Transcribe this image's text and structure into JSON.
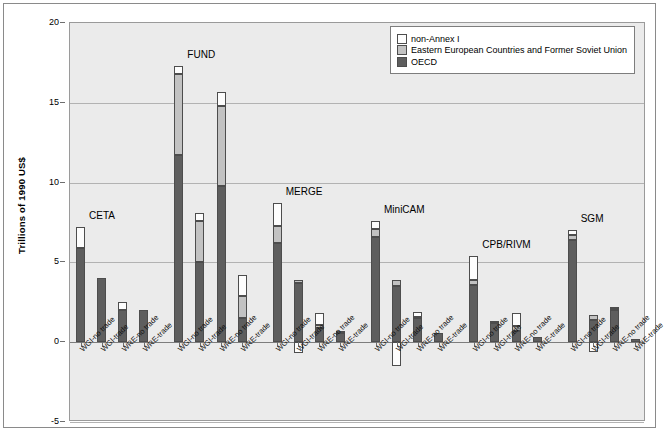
{
  "chart_data": {
    "type": "bar",
    "stacked": true,
    "title": "",
    "xlabel": "",
    "ylabel": "Trillions of 1990 US$",
    "ylim": [
      -5,
      20
    ],
    "yticks": [
      20,
      15,
      10,
      5,
      0,
      -5
    ],
    "grid": true,
    "legend_position": "top-right",
    "series": [
      {
        "name": "non-Annex I",
        "color": "#fdfdfd"
      },
      {
        "name": "Eastern European Countries and Former Soviet Union",
        "color": "#c2c2c2"
      },
      {
        "name": "OECD",
        "color": "#5e5e5e"
      }
    ],
    "scenarios": [
      "WGI-no trade",
      "WGI-trade",
      "WRE-no trade",
      "WRE-trade"
    ],
    "groups": [
      {
        "name": "CETA",
        "bars": [
          {
            "scenario": "WGI-no trade",
            "OECD": 5.9,
            "EEU": 0.0,
            "nonAnnexI": 1.3,
            "total": 7.2
          },
          {
            "scenario": "WGI-trade",
            "OECD": 4.0,
            "EEU": 0.0,
            "nonAnnexI": 0.0,
            "total": 4.0
          },
          {
            "scenario": "WRE-no trade",
            "OECD": 2.0,
            "EEU": 0.0,
            "nonAnnexI": 0.5,
            "total": 2.5
          },
          {
            "scenario": "WRE-trade",
            "OECD": 2.0,
            "EEU": 0.0,
            "nonAnnexI": 0.0,
            "total": 2.0
          }
        ]
      },
      {
        "name": "FUND",
        "bars": [
          {
            "scenario": "WGI-no trade",
            "OECD": 11.7,
            "EEU": 5.1,
            "nonAnnexI": 0.5,
            "total": 17.3
          },
          {
            "scenario": "WGI-trade",
            "OECD": 5.0,
            "EEU": 2.6,
            "nonAnnexI": 0.5,
            "total": 8.1
          },
          {
            "scenario": "WRE-no trade",
            "OECD": 9.8,
            "EEU": 5.0,
            "nonAnnexI": 0.9,
            "total": 15.7
          },
          {
            "scenario": "WRE-trade",
            "OECD": 1.5,
            "EEU": 1.4,
            "nonAnnexI": 1.3,
            "total": 4.2
          }
        ]
      },
      {
        "name": "MERGE",
        "bars": [
          {
            "scenario": "WGI-no trade",
            "OECD": 6.2,
            "EEU": 1.1,
            "nonAnnexI": 1.4,
            "total": 8.7
          },
          {
            "scenario": "WGI-trade",
            "OECD": 3.7,
            "EEU": 0.2,
            "nonAnnexI": -0.7,
            "total": 3.9
          },
          {
            "scenario": "WRE-no trade",
            "OECD": 0.9,
            "EEU": 0.2,
            "nonAnnexI": 0.7,
            "total": 1.8
          },
          {
            "scenario": "WRE-trade",
            "OECD": 0.6,
            "EEU": 0.1,
            "nonAnnexI": 0.0,
            "total": 0.7
          }
        ]
      },
      {
        "name": "MiniCAM",
        "bars": [
          {
            "scenario": "WGI-no trade",
            "OECD": 6.6,
            "EEU": 0.5,
            "nonAnnexI": 0.5,
            "total": 7.6
          },
          {
            "scenario": "WGI-trade",
            "OECD": 3.5,
            "EEU": 0.4,
            "nonAnnexI": -1.5,
            "total": 3.9
          },
          {
            "scenario": "WRE-no trade",
            "OECD": 1.5,
            "EEU": 0.1,
            "nonAnnexI": 0.3,
            "total": 1.9
          },
          {
            "scenario": "WRE-trade",
            "OECD": 0.6,
            "EEU": 0.0,
            "nonAnnexI": 0.0,
            "total": 0.6
          }
        ]
      },
      {
        "name": "CPB/RIVM",
        "bars": [
          {
            "scenario": "WGI-no trade",
            "OECD": 3.6,
            "EEU": 0.3,
            "nonAnnexI": 1.5,
            "total": 5.4
          },
          {
            "scenario": "WGI-trade",
            "OECD": 1.2,
            "EEU": 0.1,
            "nonAnnexI": 0.0,
            "total": 1.3
          },
          {
            "scenario": "WRE-no trade",
            "OECD": 0.7,
            "EEU": 0.3,
            "nonAnnexI": 0.8,
            "total": 1.8
          },
          {
            "scenario": "WRE-trade",
            "OECD": 0.3,
            "EEU": 0.0,
            "nonAnnexI": 0.0,
            "total": 0.3
          }
        ]
      },
      {
        "name": "SGM",
        "bars": [
          {
            "scenario": "WGI-no trade",
            "OECD": 6.4,
            "EEU": 0.3,
            "nonAnnexI": 0.3,
            "total": 7.0
          },
          {
            "scenario": "WGI-trade",
            "OECD": 1.4,
            "EEU": 0.3,
            "nonAnnexI": -0.6,
            "total": 1.7
          },
          {
            "scenario": "WRE-no trade",
            "OECD": 2.0,
            "EEU": 0.1,
            "nonAnnexI": 0.1,
            "total": 2.2
          },
          {
            "scenario": "WRE-trade",
            "OECD": 0.2,
            "EEU": 0.0,
            "nonAnnexI": 0.0,
            "total": 0.2
          }
        ]
      }
    ]
  }
}
